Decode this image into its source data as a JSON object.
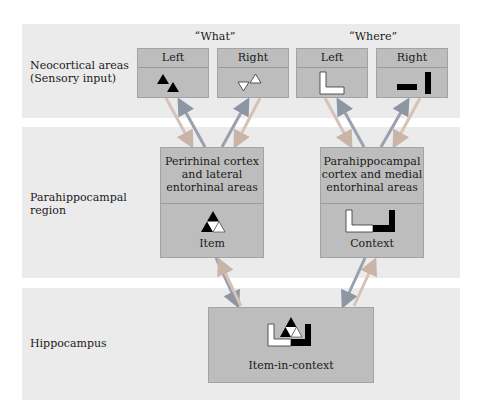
{
  "bands": [
    {
      "label_line1": "Neocortical areas",
      "label_line2": "(Sensory input)"
    },
    {
      "label_line1": "Parahippocampal",
      "label_line2": "region"
    },
    {
      "label_line1": "Hippocampus",
      "label_line2": ""
    }
  ],
  "groups": {
    "what": "“What”",
    "where": "“Where”"
  },
  "sensory_boxes": [
    {
      "label": "Left",
      "icon": "two-black-triangles-icon"
    },
    {
      "label": "Right",
      "icon": "two-white-triangles-icon"
    },
    {
      "label": "Left",
      "icon": "white-l-shape-icon"
    },
    {
      "label": "Right",
      "icon": "black-bars-icon"
    }
  ],
  "parahippocampal_boxes": [
    {
      "line1": "Perirhinal cortex",
      "line2": "and lateral",
      "line3": "entorhinal areas",
      "caption": "Item",
      "icon": "combined-triangle-icon"
    },
    {
      "line1": "Parahippocampal",
      "line2": "cortex and medial",
      "line3": "entorhinal areas",
      "caption": "Context",
      "icon": "combined-context-shape-icon"
    }
  ],
  "hippocampus_box": {
    "caption": "Item-in-context",
    "icon": "item-in-context-icon"
  },
  "colors": {
    "band": "#ebebeb",
    "box": "#bdbdbd",
    "arrow_light": "#d6c3b8",
    "arrow_dark": "#9aa0ad"
  }
}
